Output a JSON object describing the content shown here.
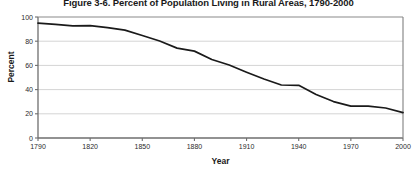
{
  "chart_data": {
    "type": "line",
    "title": "Figure 3-6. Percent of Population Living in Rural Areas, 1790-2000",
    "xlabel": "Year",
    "ylabel": "Percent",
    "xlim": [
      1790,
      2000
    ],
    "ylim": [
      0,
      100
    ],
    "grid": true,
    "grid_axis": "y",
    "legend": "none",
    "line_color": "#1a1a1a",
    "yticks": [
      0,
      20,
      40,
      60,
      80,
      100
    ],
    "ytick_labels": [
      "0",
      "20",
      "40",
      "60",
      "80",
      "100"
    ],
    "xticks": [
      1790,
      1820,
      1850,
      1880,
      1910,
      1940,
      1970,
      2000
    ],
    "xtick_labels": [
      "1790",
      "1820",
      "1850",
      "1880",
      "1910",
      "1940",
      "1970",
      "2000"
    ],
    "x": [
      1790,
      1800,
      1810,
      1820,
      1830,
      1840,
      1850,
      1860,
      1870,
      1880,
      1890,
      1900,
      1910,
      1920,
      1930,
      1940,
      1950,
      1960,
      1970,
      1980,
      1990,
      2000
    ],
    "values": [
      94.9,
      93.9,
      92.7,
      92.8,
      91.2,
      89.2,
      84.7,
      80.2,
      74.3,
      71.8,
      64.9,
      60.3,
      54.4,
      48.8,
      43.8,
      43.5,
      36.0,
      30.1,
      26.3,
      26.3,
      24.8,
      21.0
    ],
    "series": [
      {
        "name": "Percent rural",
        "values": [
          94.9,
          93.9,
          92.7,
          92.8,
          91.2,
          89.2,
          84.7,
          80.2,
          74.3,
          71.8,
          64.9,
          60.3,
          54.4,
          48.8,
          43.8,
          43.5,
          36.0,
          30.1,
          26.3,
          26.3,
          24.8,
          21.0
        ]
      }
    ]
  }
}
